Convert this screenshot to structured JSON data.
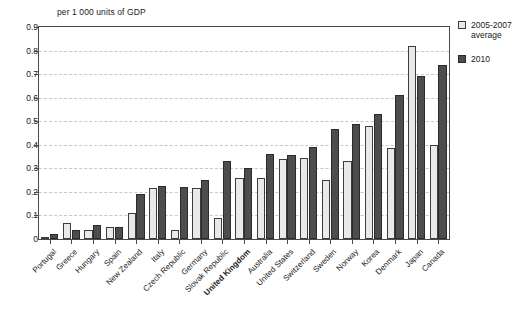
{
  "chart_data": {
    "type": "bar",
    "title": "per 1 000 units of GDP",
    "xlabel": "",
    "ylabel": "per 1 000 units of GDP",
    "ylim": [
      0,
      0.9
    ],
    "ytick_labels": [
      "0",
      "0.1",
      "0.2",
      "0.3",
      "0.4",
      "0.5",
      "0.6",
      "0.7",
      "0.8",
      "0.9"
    ],
    "ytick_values": [
      0,
      0.1,
      0.2,
      0.3,
      0.4,
      0.5,
      0.6,
      0.7,
      0.8,
      0.9
    ],
    "grid": true,
    "legend_position": "right",
    "highlight_category": "United Kingdom",
    "categories": [
      "Portugal",
      "Greece",
      "Hungary",
      "Spain",
      "New Zealand",
      "Italy",
      "Czech Republic",
      "Germany",
      "Slovak Republic",
      "United Kingdom",
      "Australia",
      "United States",
      "Switzerland",
      "Sweden",
      "Norway",
      "Korea",
      "Denmark",
      "Japan",
      "Canada"
    ],
    "series": [
      {
        "name": "2005-2007 average",
        "color": "#e9e9e9",
        "values": [
          0.01,
          0.07,
          0.04,
          0.05,
          0.11,
          0.215,
          0.04,
          0.215,
          0.09,
          0.26,
          0.26,
          0.34,
          0.345,
          0.25,
          0.33,
          0.48,
          0.385,
          0.82,
          0.4
        ]
      },
      {
        "name": "2010",
        "color": "#4d4d4d",
        "values": [
          0.02,
          0.04,
          0.06,
          0.05,
          0.19,
          0.225,
          0.22,
          0.25,
          0.33,
          0.3,
          0.36,
          0.355,
          0.39,
          0.465,
          0.49,
          0.53,
          0.61,
          0.69,
          0.74
        ]
      }
    ]
  },
  "legend": {
    "items": [
      {
        "label": "2005-2007",
        "label2": "average",
        "swatch": "light"
      },
      {
        "label": "2010",
        "label2": "",
        "swatch": "dark"
      }
    ]
  }
}
